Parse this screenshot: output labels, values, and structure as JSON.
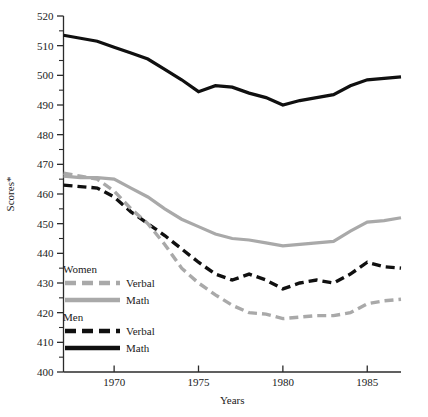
{
  "chart_data": {
    "type": "line",
    "title": "",
    "xlabel": "Years",
    "ylabel": "Scores*",
    "xlim": [
      1967,
      1987
    ],
    "ylim": [
      400,
      520
    ],
    "x": [
      1967,
      1968,
      1969,
      1970,
      1971,
      1972,
      1973,
      1974,
      1975,
      1976,
      1977,
      1978,
      1979,
      1980,
      1981,
      1982,
      1983,
      1984,
      1985,
      1986,
      1987
    ],
    "x_ticks": [
      1970,
      1975,
      1980,
      1985
    ],
    "x_tick_labels": [
      "1970",
      "1975",
      "1980",
      "1985"
    ],
    "y_ticks": [
      400,
      410,
      420,
      430,
      440,
      450,
      460,
      470,
      480,
      490,
      500,
      510,
      520
    ],
    "y_tick_labels": [
      "400",
      "410",
      "420",
      "430",
      "440",
      "450",
      "460",
      "470",
      "480",
      "490",
      "500",
      "510",
      "520"
    ],
    "y_minor_ticks": [
      405,
      415,
      425,
      435,
      445,
      455,
      465,
      475,
      485,
      495,
      505,
      515
    ],
    "grid": false,
    "legend_position": "inner-left-lower",
    "series": [
      {
        "name": "Men Math",
        "group": "Men",
        "subject": "Math",
        "color": "#101010",
        "style": "solid",
        "values": [
          513.5,
          512.5,
          511.5,
          509.5,
          507.5,
          505.5,
          502.0,
          498.5,
          494.5,
          496.5,
          496.0,
          494.0,
          492.5,
          490.0,
          491.5,
          492.5,
          493.5,
          496.5,
          498.5,
          499.0,
          499.5
        ]
      },
      {
        "name": "Women Math",
        "group": "Women",
        "subject": "Math",
        "color": "#a9a9a9",
        "style": "solid",
        "values": [
          466.0,
          465.5,
          465.5,
          465.0,
          462.0,
          459.0,
          455.0,
          451.5,
          449.0,
          446.5,
          445.0,
          444.5,
          443.5,
          442.5,
          443.0,
          443.5,
          444.0,
          447.5,
          450.5,
          451.0,
          452.0
        ]
      },
      {
        "name": "Men Verbal",
        "group": "Men",
        "subject": "Verbal",
        "color": "#101010",
        "style": "dashed",
        "values": [
          463.0,
          462.5,
          462.0,
          459.0,
          454.0,
          450.0,
          446.0,
          441.5,
          437.0,
          433.0,
          431.0,
          433.0,
          431.0,
          428.0,
          430.0,
          431.0,
          430.0,
          433.0,
          437.0,
          435.5,
          435.0
        ]
      },
      {
        "name": "Women Verbal",
        "group": "Women",
        "subject": "Verbal",
        "color": "#a9a9a9",
        "style": "dashed",
        "values": [
          467.0,
          466.0,
          465.0,
          461.0,
          455.0,
          450.0,
          443.0,
          435.0,
          430.0,
          426.0,
          422.5,
          420.0,
          419.5,
          418.0,
          418.5,
          419.0,
          419.0,
          420.0,
          423.0,
          424.0,
          424.5
        ]
      }
    ],
    "legend": {
      "groups": [
        {
          "heading": "Women",
          "entries": [
            {
              "label": "Verbal",
              "color": "#a9a9a9",
              "style": "dashed"
            },
            {
              "label": "Math",
              "color": "#a9a9a9",
              "style": "solid"
            }
          ]
        },
        {
          "heading": "Men",
          "entries": [
            {
              "label": "Verbal",
              "color": "#101010",
              "style": "dashed"
            },
            {
              "label": "Math",
              "color": "#101010",
              "style": "solid"
            }
          ]
        }
      ]
    },
    "colors": {
      "women": "#a9a9a9",
      "men": "#101010",
      "axis": "#2b2b2b",
      "background": "#ffffff"
    }
  }
}
